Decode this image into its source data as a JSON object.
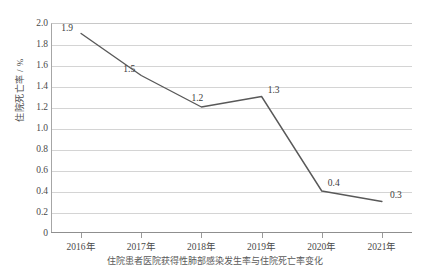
{
  "chart_data": {
    "type": "line",
    "title": "",
    "xlabel": "",
    "ylabel": "住院死亡率 / %",
    "categories": [
      "2016年",
      "2017年",
      "2018年",
      "2019年",
      "2020年",
      "2021年"
    ],
    "values": [
      1.9,
      1.5,
      1.2,
      1.3,
      0.4,
      0.3
    ],
    "point_labels": [
      "1.9",
      "1.5",
      "1.2",
      "1.3",
      "0.4",
      "0.3"
    ],
    "ylim": [
      0,
      2.0
    ],
    "ytick_labels": [
      "0",
      "0.2",
      "0.4",
      "0.6",
      "0.8",
      "1.0",
      "1.2",
      "1.4",
      "1.6",
      "1.8",
      "2.0"
    ],
    "ytick_values": [
      0,
      0.2,
      0.4,
      0.6,
      0.8,
      1.0,
      1.2,
      1.4,
      1.6,
      1.8,
      2.0
    ],
    "grid": true,
    "legend": false,
    "legend_position": "none",
    "series_color": "#595959",
    "grid_color": "#d4d4d4",
    "axis_color": "#8f8f8f"
  },
  "caption": {
    "text": "住院患者医院获得性肺部感染发生率与住院死亡率变化"
  }
}
